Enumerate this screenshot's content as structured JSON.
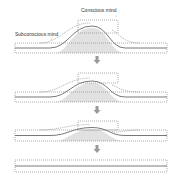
{
  "labels": {
    "conscious": "Conscious mind",
    "subconscious": "Subconscious mind"
  },
  "colors": {
    "line": "#555555",
    "dash": "#777777",
    "fill": "#d9d9d9",
    "arrow": "#9a9a9a"
  },
  "panels": [
    {
      "stage": 1,
      "box_top": 20,
      "box_bottom": 33,
      "band_top": 43,
      "band_bottom": 53,
      "bump_height": 22
    },
    {
      "stage": 2,
      "box_top": 73,
      "box_bottom": 83,
      "band_top": 92,
      "band_bottom": 102,
      "bump_height": 16
    },
    {
      "stage": 3,
      "box_top": 121,
      "box_bottom": 130,
      "band_top": 130,
      "band_bottom": 141,
      "bump_height": 8
    },
    {
      "stage": 4,
      "box_top": null,
      "box_bottom": null,
      "band_top": 160,
      "band_bottom": 172,
      "bump_height": 0
    }
  ],
  "arrows": [
    {
      "x": 97,
      "y": 56
    },
    {
      "x": 97,
      "y": 106
    },
    {
      "x": 97,
      "y": 145
    }
  ]
}
